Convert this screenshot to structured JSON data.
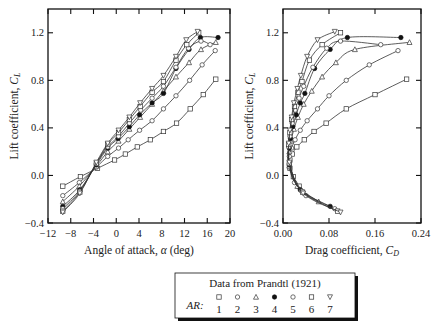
{
  "chart_data": [
    {
      "type": "line",
      "title": "",
      "xlabel": "Angle of attack, α (deg)",
      "ylabel": "Lift coefficient, C_L",
      "xlim": [
        -12,
        20
      ],
      "ylim": [
        -0.4,
        1.4
      ],
      "xticks": [
        "−12",
        "−8",
        "−4",
        "0",
        "4",
        "8",
        "12",
        "16",
        "20"
      ],
      "xtick_values": [
        -12,
        -8,
        -4,
        0,
        4,
        8,
        12,
        16,
        20
      ],
      "yticks": [
        "−0.4",
        "0.0",
        "0.4",
        "0.8",
        "1.2"
      ],
      "ytick_values": [
        -0.4,
        0.0,
        0.4,
        0.8,
        1.2
      ],
      "grid": false,
      "series": [
        {
          "name": "AR 1",
          "marker": "square-open",
          "x": [
            -9.4,
            -6.3,
            -3.3,
            -0.3,
            1.6,
            3.7,
            6.0,
            8.3,
            10.6,
            13.0,
            15.3,
            17.5
          ],
          "y": [
            -0.09,
            -0.01,
            0.06,
            0.13,
            0.18,
            0.24,
            0.3,
            0.37,
            0.44,
            0.56,
            0.68,
            0.81
          ]
        },
        {
          "name": "AR 2",
          "marker": "circle-open",
          "x": [
            -9.4,
            -6.5,
            -3.5,
            -1.5,
            0.4,
            2.1,
            4.1,
            6.3,
            8.3,
            10.5,
            12.9,
            15.1,
            17.4
          ],
          "y": [
            -0.17,
            -0.06,
            0.07,
            0.16,
            0.23,
            0.3,
            0.38,
            0.46,
            0.56,
            0.67,
            0.8,
            0.93,
            1.05
          ]
        },
        {
          "name": "AR 3",
          "marker": "triangle-open",
          "x": [
            -9.4,
            -6.5,
            -3.5,
            -1.5,
            0.4,
            2.3,
            4.2,
            6.3,
            8.3,
            10.5,
            12.8,
            14.9,
            17.5
          ],
          "y": [
            -0.22,
            -0.09,
            0.08,
            0.2,
            0.29,
            0.39,
            0.49,
            0.6,
            0.71,
            0.83,
            0.95,
            1.06,
            1.12
          ]
        },
        {
          "name": "AR 4",
          "marker": "circle-filled",
          "x": [
            -9.4,
            -6.4,
            -3.5,
            -1.5,
            0.3,
            2.3,
            4.1,
            6.3,
            8.3,
            10.5,
            12.8,
            14.8,
            17.9
          ],
          "y": [
            -0.26,
            -0.12,
            0.09,
            0.23,
            0.31,
            0.41,
            0.51,
            0.61,
            0.69,
            0.9,
            1.06,
            1.16,
            1.16
          ]
        },
        {
          "name": "AR 5",
          "marker": "circle-open",
          "x": [
            -9.4,
            -6.4,
            -3.5,
            -1.5,
            0.4,
            2.3,
            4.3,
            6.3,
            8.3,
            10.5,
            12.7,
            14.9,
            16.5
          ],
          "y": [
            -0.28,
            -0.13,
            0.1,
            0.24,
            0.33,
            0.44,
            0.55,
            0.65,
            0.75,
            0.91,
            1.07,
            1.13,
            1.1
          ]
        },
        {
          "name": "AR 6",
          "marker": "square-open",
          "x": [
            -9.4,
            -6.4,
            -3.5,
            -1.5,
            0.4,
            2.3,
            4.2,
            6.3,
            8.3,
            10.5,
            12.4,
            14.5
          ],
          "y": [
            -0.3,
            -0.14,
            0.1,
            0.26,
            0.36,
            0.47,
            0.58,
            0.7,
            0.79,
            0.97,
            1.1,
            1.2
          ]
        },
        {
          "name": "AR 7",
          "marker": "triangle-down-open",
          "x": [
            -9.4,
            -6.4,
            -3.5,
            -1.5,
            0.4,
            2.3,
            4.2,
            6.3,
            8.3,
            10.5,
            12.3,
            14.3
          ],
          "y": [
            -0.31,
            -0.15,
            0.11,
            0.27,
            0.38,
            0.49,
            0.61,
            0.73,
            0.84,
            1.0,
            1.14,
            1.21
          ]
        }
      ]
    },
    {
      "type": "line",
      "title": "",
      "xlabel": "Drag coefficient, C_D",
      "ylabel": "Lift coefficient, C_L",
      "xlim": [
        0.0,
        0.24
      ],
      "ylim": [
        -0.4,
        1.4
      ],
      "xticks": [
        "0.00",
        "0.08",
        "0.16",
        "0.24"
      ],
      "xtick_values": [
        0.0,
        0.08,
        0.16,
        0.24
      ],
      "yticks": [
        "−0.4",
        "0.0",
        "0.4",
        "0.8",
        "1.2"
      ],
      "ytick_values": [
        -0.4,
        0.0,
        0.4,
        0.8,
        1.2
      ],
      "grid": false,
      "series": [
        {
          "name": "AR 1",
          "marker": "square-open",
          "x": [
            0.028,
            0.018,
            0.012,
            0.012,
            0.016,
            0.024,
            0.037,
            0.054,
            0.075,
            0.11,
            0.16,
            0.215
          ],
          "y": [
            -0.09,
            -0.01,
            0.06,
            0.13,
            0.18,
            0.24,
            0.3,
            0.37,
            0.44,
            0.56,
            0.68,
            0.81
          ]
        },
        {
          "name": "AR 2",
          "marker": "circle-open",
          "x": [
            0.04,
            0.02,
            0.011,
            0.011,
            0.015,
            0.021,
            0.03,
            0.042,
            0.06,
            0.08,
            0.11,
            0.15,
            0.2
          ],
          "y": [
            -0.17,
            -0.06,
            0.07,
            0.16,
            0.23,
            0.3,
            0.38,
            0.46,
            0.56,
            0.67,
            0.8,
            0.93,
            1.05
          ]
        },
        {
          "name": "AR 3",
          "marker": "triangle-open",
          "x": [
            0.062,
            0.025,
            0.011,
            0.011,
            0.014,
            0.019,
            0.026,
            0.036,
            0.05,
            0.068,
            0.092,
            0.125,
            0.22
          ],
          "y": [
            -0.22,
            -0.09,
            0.08,
            0.2,
            0.29,
            0.39,
            0.49,
            0.6,
            0.71,
            0.83,
            0.95,
            1.06,
            1.12
          ]
        },
        {
          "name": "AR 4",
          "marker": "circle-filled",
          "x": [
            0.082,
            0.03,
            0.011,
            0.011,
            0.013,
            0.017,
            0.023,
            0.03,
            0.038,
            0.055,
            0.082,
            0.112,
            0.205
          ],
          "y": [
            -0.26,
            -0.12,
            0.09,
            0.23,
            0.31,
            0.41,
            0.51,
            0.61,
            0.69,
            0.9,
            1.06,
            1.16,
            1.16
          ]
        },
        {
          "name": "AR 5",
          "marker": "circle-open",
          "x": [
            0.09,
            0.032,
            0.011,
            0.01,
            0.012,
            0.016,
            0.021,
            0.028,
            0.036,
            0.052,
            0.076,
            0.1,
            0.17
          ],
          "y": [
            -0.28,
            -0.13,
            0.1,
            0.24,
            0.33,
            0.44,
            0.55,
            0.65,
            0.75,
            0.91,
            1.07,
            1.13,
            1.1
          ]
        },
        {
          "name": "AR 6",
          "marker": "square-open",
          "x": [
            0.095,
            0.034,
            0.011,
            0.01,
            0.012,
            0.015,
            0.02,
            0.026,
            0.033,
            0.046,
            0.068,
            0.1
          ],
          "y": [
            -0.3,
            -0.14,
            0.1,
            0.26,
            0.36,
            0.47,
            0.58,
            0.7,
            0.79,
            0.97,
            1.1,
            1.2
          ]
        },
        {
          "name": "AR 7",
          "marker": "triangle-down-open",
          "x": [
            0.1,
            0.035,
            0.011,
            0.01,
            0.012,
            0.015,
            0.019,
            0.025,
            0.031,
            0.042,
            0.06,
            0.09
          ],
          "y": [
            -0.31,
            -0.15,
            0.11,
            0.27,
            0.38,
            0.49,
            0.61,
            0.73,
            0.84,
            1.0,
            1.14,
            1.21
          ]
        }
      ]
    }
  ],
  "legend": {
    "title": "Data from Prandtl (1921)",
    "prefix": "AR:",
    "entries": [
      {
        "label": "1",
        "marker": "square-open"
      },
      {
        "label": "2",
        "marker": "circle-open"
      },
      {
        "label": "3",
        "marker": "triangle-open"
      },
      {
        "label": "4",
        "marker": "circle-filled"
      },
      {
        "label": "5",
        "marker": "circle-open"
      },
      {
        "label": "6",
        "marker": "square-open"
      },
      {
        "label": "7",
        "marker": "triangle-down-open"
      }
    ],
    "placement": "bottom-center"
  }
}
